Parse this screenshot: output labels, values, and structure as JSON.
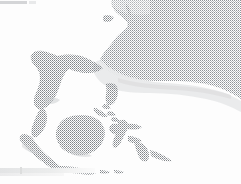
{
  "map": {
    "title": "Southeast Asia",
    "render_style": "halftone dithered grayscale raster",
    "width_px": 241,
    "height_px": 184,
    "background_color": "#fdfdfd",
    "colors": {
      "ocean_dot_dark": "#8f9398",
      "ocean_dot_light": "#b9bcc0",
      "land_dot_dark": "#808488",
      "land_dot_light": "#a9acb0",
      "shelf_band": "#e6e7e8",
      "artifact_gray": "#d4d5d7",
      "paper_white": "#ffffff"
    },
    "regions": {
      "dotted_sea": {
        "name": "South China Sea / Western Pacific dotted zone",
        "position": "upper-right",
        "fill": "halftone dots",
        "boundary": "coastline on the west, smooth curved southern edge"
      },
      "shelf": {
        "name": "shallow shelf band",
        "position": "below dotted sea, center-right",
        "fill": "soft light gray"
      }
    },
    "landmasses": [
      {
        "name": "Indochina Peninsula",
        "position": "upper-left"
      },
      {
        "name": "Malay Peninsula",
        "position": "left-center"
      },
      {
        "name": "Sumatra",
        "position": "lower-left"
      },
      {
        "name": "Java",
        "position": "bottom-center-left"
      },
      {
        "name": "Lesser Sunda Islands",
        "position": "bottom-center"
      },
      {
        "name": "Borneo",
        "position": "center"
      },
      {
        "name": "Sulawesi",
        "position": "center-right"
      },
      {
        "name": "Philippines (Luzon, Mindoro, Panay, Mindanao)",
        "position": "upper-center-right"
      },
      {
        "name": "Palawan",
        "position": "center-right of Borneo"
      },
      {
        "name": "Halmahera",
        "position": "right-center"
      },
      {
        "name": "Hainan",
        "position": "top-left of dotted zone"
      }
    ],
    "artifacts": [
      {
        "name": "top-left gray bar",
        "position": "x0-27, y1-4"
      },
      {
        "name": "bottom-left gray band",
        "position": "x0-95, y168-176"
      }
    ]
  }
}
